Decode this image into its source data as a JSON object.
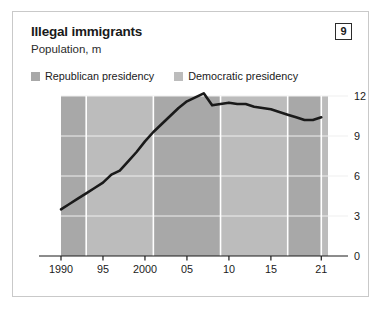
{
  "card": {
    "title": "Illegal immigrants",
    "subtitle": "Population, m",
    "badge": "9"
  },
  "legend": {
    "items": [
      {
        "label": "Republican presidency",
        "color": "#a8a8a8"
      },
      {
        "label": "Democratic presidency",
        "color": "#bcbcbc"
      }
    ]
  },
  "colors": {
    "line": "#1a1a1a",
    "republican_band": "#a8a8a8",
    "democratic_band": "#bcbcbc",
    "gridline": "#efefef",
    "divider": "#ffffff",
    "axis": "#1a1a1a",
    "card_border": "#c9c9c9"
  },
  "chart_data": {
    "type": "line",
    "title": "Illegal immigrants",
    "subtitle": "Population, m",
    "xlabel": "",
    "ylabel": "Population, m",
    "ylim": [
      0,
      12
    ],
    "xlim": [
      1990,
      2021
    ],
    "yticks": [
      0,
      3,
      6,
      9,
      12
    ],
    "ytick_labels": [
      "0",
      "3",
      "6",
      "9",
      "12"
    ],
    "xticks": [
      1990,
      1995,
      2000,
      2005,
      2010,
      2015,
      2021
    ],
    "xtick_labels": [
      "1990",
      "95",
      "2000",
      "05",
      "10",
      "15",
      "21"
    ],
    "grid": true,
    "legend_position": "top-left",
    "series": [
      {
        "name": "Illegal immigrant population",
        "x": [
          1990,
          1991,
          1992,
          1993,
          1994,
          1995,
          1996,
          1997,
          1998,
          1999,
          2000,
          2001,
          2002,
          2003,
          2004,
          2005,
          2006,
          2007,
          2008,
          2009,
          2010,
          2011,
          2012,
          2013,
          2014,
          2015,
          2016,
          2017,
          2018,
          2019,
          2020,
          2021
        ],
        "values": [
          3.5,
          3.9,
          4.3,
          4.7,
          5.1,
          5.5,
          6.1,
          6.4,
          7.1,
          7.8,
          8.6,
          9.3,
          9.9,
          10.5,
          11.1,
          11.6,
          11.9,
          12.2,
          11.3,
          11.4,
          11.5,
          11.4,
          11.4,
          11.2,
          11.1,
          11.0,
          10.8,
          10.6,
          10.4,
          10.2,
          10.2,
          10.4
        ]
      }
    ],
    "presidency_bands": [
      {
        "party": "Republican",
        "start": 1990,
        "end": 1993
      },
      {
        "party": "Democratic",
        "start": 1993,
        "end": 2001
      },
      {
        "party": "Republican",
        "start": 2001,
        "end": 2009
      },
      {
        "party": "Democratic",
        "start": 2009,
        "end": 2017
      },
      {
        "party": "Republican",
        "start": 2017,
        "end": 2021
      },
      {
        "party": "Democratic",
        "start": 2021,
        "end": 2021.8
      }
    ]
  }
}
